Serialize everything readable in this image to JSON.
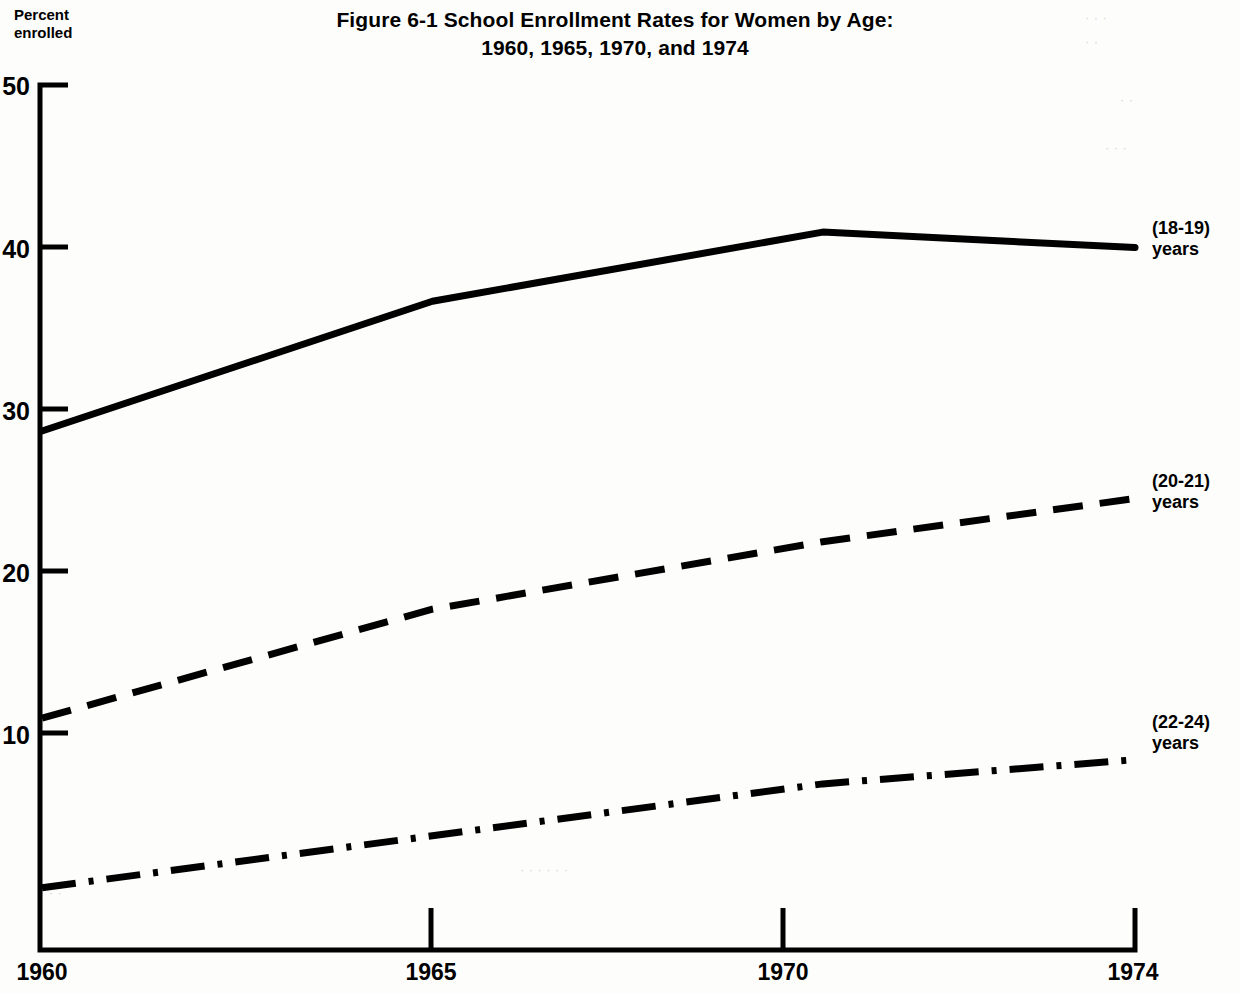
{
  "axis_label": "Percent\nenrolled",
  "title": {
    "line1": "Figure 6-1  School Enrollment Rates for Women by Age:",
    "line2": "1960, 1965, 1970, and 1974"
  },
  "series_labels": [
    "(18-19)\nyears",
    "(20-21)\nyears",
    "(22-24)\nyears"
  ],
  "ticks": {
    "y": [
      "50",
      "40",
      "30",
      "20",
      "10"
    ],
    "x": [
      "1960",
      "1965",
      "1970",
      "1974"
    ]
  },
  "chart_data": {
    "type": "line",
    "title": "Figure 6-1  School Enrollment Rates for Women by Age: 1960, 1965, 1970, and 1974",
    "xlabel": "",
    "ylabel": "Percent enrolled",
    "x": [
      1960,
      1965,
      1970,
      1974
    ],
    "xtick_labels": [
      "1960",
      "1965",
      "1970",
      "1974"
    ],
    "ytick_labels": [
      "10",
      "20",
      "30",
      "40",
      "50"
    ],
    "yticks": [
      10,
      20,
      30,
      40,
      50
    ],
    "xlim": [
      1960,
      1974
    ],
    "ylim": [
      0,
      50
    ],
    "grid": false,
    "legend_position": "right-of-line-end",
    "series": [
      {
        "name": "(18-19) years",
        "label": "(18-19)\nyears",
        "linestyle": "solid",
        "color": "#000000",
        "values": [
          30.0,
          37.5,
          41.5,
          40.6
        ]
      },
      {
        "name": "(20-21) years",
        "label": "(20-21)\nyears",
        "linestyle": "dashed",
        "color": "#000000",
        "values": [
          13.4,
          19.7,
          23.6,
          26.1
        ]
      },
      {
        "name": "(22-24) years",
        "label": "(22-24)\nyears",
        "linestyle": "dashdot",
        "color": "#000000",
        "values": [
          3.6,
          6.6,
          9.6,
          11.0
        ]
      }
    ]
  },
  "colors": {
    "ink": "#000000",
    "paper": "#fdfdfc"
  }
}
